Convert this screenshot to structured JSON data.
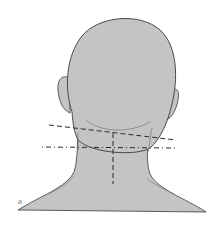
{
  "figure": {
    "panel_label": "a",
    "colors": {
      "skin_fill": "#c4c4c4",
      "outline": "#3a3a3a",
      "dashed_line": "#2a2a2a",
      "background": "#ffffff"
    },
    "annotations": [
      {
        "type": "dashed-line",
        "description": "oblique line across upper neck"
      },
      {
        "type": "dash-dot-line",
        "description": "horizontal line across neck"
      },
      {
        "type": "dashed-line",
        "description": "vertical midline of neck"
      }
    ]
  }
}
